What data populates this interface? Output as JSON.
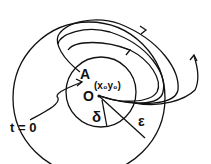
{
  "diagram": {
    "labels": {
      "point_a": "A",
      "coords": "(x₀y₀)",
      "origin": "O",
      "delta": "δ",
      "epsilon": "ε",
      "start_time": "t = 0"
    },
    "colors": {
      "stroke": "#111111",
      "background": "#ffffff"
    }
  }
}
